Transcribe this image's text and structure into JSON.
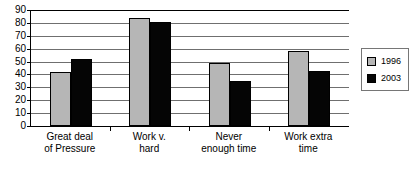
{
  "chart_data": {
    "type": "bar",
    "title": "",
    "subtitle": "",
    "xlabel": "",
    "ylabel": "",
    "ylim": [
      0,
      90
    ],
    "ytick_step": 10,
    "yticks": [
      90,
      80,
      70,
      60,
      50,
      40,
      30,
      20,
      10,
      0
    ],
    "grid": true,
    "legend_position": "right",
    "categories": [
      "Great deal\nof Pressure",
      "Work v.\nhard",
      "Never\nenough time",
      "Work extra\ntime"
    ],
    "series": [
      {
        "name": "1996",
        "color": "#b6b6b6",
        "values": [
          42,
          84,
          49,
          58
        ]
      },
      {
        "name": "2003",
        "color": "#050505",
        "values": [
          52,
          81,
          35,
          43
        ]
      }
    ]
  },
  "legend": {
    "items": [
      {
        "label": "1996",
        "swatch": "legend-swatch-1996"
      },
      {
        "label": "2003",
        "swatch": "legend-swatch-2003"
      }
    ]
  },
  "axis": {
    "y_labels": [
      "90",
      "80",
      "70",
      "60",
      "50",
      "40",
      "30",
      "20",
      "10",
      "0"
    ]
  }
}
